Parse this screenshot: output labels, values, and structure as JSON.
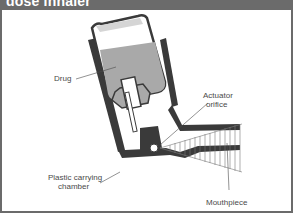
{
  "header": {
    "title": "dose inhaler"
  },
  "diagram": {
    "labels": {
      "drug": "Drug",
      "actuator_line1": "Actuator",
      "actuator_line2": "orifice",
      "chamber_line1": "Plastic carrying",
      "chamber_line2": "chamber",
      "mouthpiece": "Mouthpiece"
    },
    "colors": {
      "header_bg": "#6b6b6b",
      "outline": "#3a3a3a",
      "drug_fill": "#a9a9a9",
      "text": "#4a4a4a"
    }
  }
}
